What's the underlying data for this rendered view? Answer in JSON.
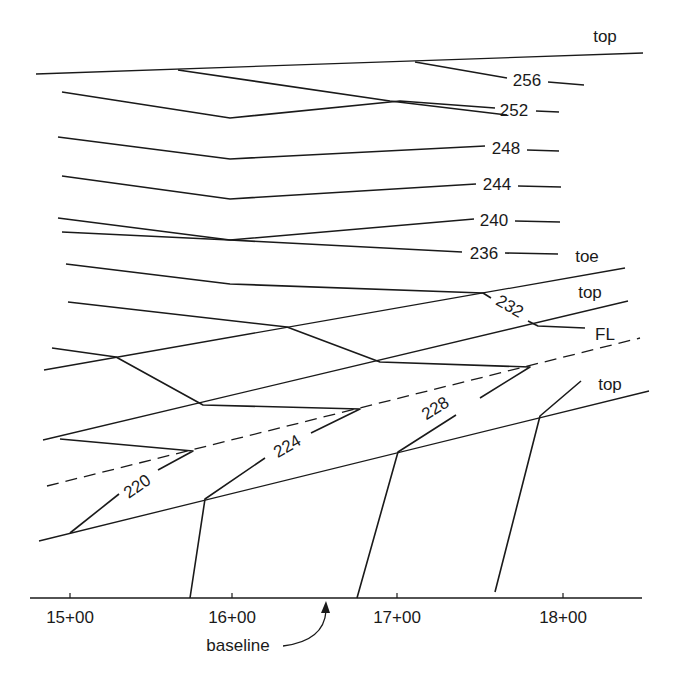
{
  "diagram": {
    "stroke_color": "#1a1a1a",
    "background": "#ffffff"
  },
  "baseline": {
    "label": "baseline",
    "y": 598,
    "x_start": 30,
    "x_end": 642,
    "stations": [
      {
        "label": "15+00",
        "x": 70
      },
      {
        "label": "16+00",
        "x": 232
      },
      {
        "label": "17+00",
        "x": 397
      },
      {
        "label": "18+00",
        "x": 563
      }
    ],
    "arrow": {
      "from": [
        283,
        646
      ],
      "to": [
        326,
        601
      ]
    }
  },
  "slope_lines": [
    {
      "name": "top-upper",
      "label": "top",
      "points": [
        [
          36,
          74
        ],
        [
          643,
          53
        ]
      ],
      "dashed": false,
      "label_pos": [
        605,
        42
      ]
    },
    {
      "name": "toe",
      "label": "toe",
      "points": [
        [
          44,
          370
        ],
        [
          625,
          268
        ]
      ],
      "dashed": false,
      "label_pos": [
        587,
        262
      ]
    },
    {
      "name": "top-middle",
      "label": "top",
      "points": [
        [
          43,
          440
        ],
        [
          628,
          301
        ]
      ],
      "dashed": false,
      "label_pos": [
        590,
        298
      ]
    },
    {
      "name": "fill-line",
      "label": "FL",
      "points": [
        [
          47,
          486
        ],
        [
          640,
          338
        ]
      ],
      "dashed": true,
      "label_pos": [
        605,
        340
      ]
    },
    {
      "name": "top-lower",
      "label": "top",
      "points": [
        [
          39,
          541
        ],
        [
          649,
          391
        ]
      ],
      "dashed": false,
      "label_pos": [
        610,
        390
      ]
    }
  ],
  "contours": [
    {
      "value": "256",
      "points": [
        [
          178,
          70
        ],
        [
          290,
          88
        ],
        [
          390,
          102
        ],
        [
          415,
          90
        ],
        [
          400,
          93
        ]
      ],
      "segments": [
        [
          [
            178,
            70
          ],
          [
            390,
            101
          ],
          [
            507,
            115
          ]
        ],
        [
          [
            415,
            62
          ],
          [
            507,
            78
          ]
        ],
        [
          [
            548,
            82
          ],
          [
            584,
            85
          ]
        ]
      ],
      "label_pos": [
        527,
        86
      ],
      "rotate": 0
    },
    {
      "value": "252",
      "segments": [
        [
          [
            62,
            92
          ],
          [
            230,
            118
          ],
          [
            400,
            101
          ],
          [
            495,
            108
          ]
        ],
        [
          [
            536,
            111
          ],
          [
            559,
            112
          ]
        ]
      ],
      "label_pos": [
        514,
        116
      ],
      "rotate": 0
    },
    {
      "value": "248",
      "segments": [
        [
          [
            58,
            137
          ],
          [
            230,
            159
          ],
          [
            485,
            146
          ]
        ],
        [
          [
            527,
            150
          ],
          [
            559,
            151
          ]
        ]
      ],
      "label_pos": [
        506,
        154
      ],
      "rotate": 0
    },
    {
      "value": "244",
      "segments": [
        [
          [
            62,
            176
          ],
          [
            230,
            199
          ],
          [
            476,
            184
          ]
        ],
        [
          [
            518,
            186
          ],
          [
            561,
            187
          ]
        ]
      ],
      "label_pos": [
        497,
        190
      ],
      "rotate": 0
    },
    {
      "value": "240",
      "segments": [
        [
          [
            58,
            218
          ],
          [
            230,
            240
          ],
          [
            474,
            219
          ]
        ],
        [
          [
            515,
            221
          ],
          [
            560,
            222
          ]
        ]
      ],
      "label_pos": [
        494,
        226
      ],
      "rotate": 0
    },
    {
      "value": "236",
      "segments": [
        [
          [
            62,
            232
          ],
          [
            230,
            240
          ],
          [
            462,
            252
          ]
        ],
        [
          [
            505,
            253
          ],
          [
            558,
            254
          ]
        ]
      ],
      "label_pos": [
        484,
        259
      ],
      "rotate": 0
    },
    {
      "value": "232",
      "segments": [
        [
          [
            66,
            264
          ],
          [
            230,
            284
          ],
          [
            483,
            293
          ],
          [
            491,
            298
          ]
        ],
        [
          [
            528,
            321
          ],
          [
            538,
            326
          ],
          [
            585,
            328
          ]
        ]
      ],
      "label_pos": [
        510,
        312
      ],
      "rotate": 30
    },
    {
      "value": "228",
      "segments": [
        [
          [
            68,
            302
          ],
          [
            287,
            327
          ],
          [
            380,
            362
          ],
          [
            530,
            367
          ],
          [
            480,
            398
          ]
        ],
        [
          [
            456,
            415
          ],
          [
            398,
            452
          ],
          [
            357,
            598
          ]
        ]
      ],
      "label_pos": [
        435,
        414
      ],
      "rotate": -32
    },
    {
      "value": "224",
      "segments": [
        [
          [
            52,
            348
          ],
          [
            116,
            357
          ],
          [
            203,
            405
          ],
          [
            360,
            409
          ],
          [
            311,
            433
          ]
        ],
        [
          [
            265,
            458
          ],
          [
            205,
            499
          ],
          [
            190,
            598
          ]
        ]
      ],
      "label_pos": [
        287,
        452
      ],
      "rotate": -30
    },
    {
      "value": "220",
      "segments": [
        [
          [
            60,
            439
          ],
          [
            193,
            451
          ],
          [
            158,
            470
          ]
        ],
        [
          [
            119,
            494
          ],
          [
            70,
            533
          ]
        ]
      ],
      "label_pos": [
        137,
        492
      ],
      "rotate": -35
    },
    {
      "value": "",
      "segments": [
        [
          [
            581,
            381
          ],
          [
            540,
            416
          ],
          [
            495,
            592
          ]
        ]
      ],
      "label_pos": [
        0,
        0
      ],
      "rotate": 0
    }
  ]
}
